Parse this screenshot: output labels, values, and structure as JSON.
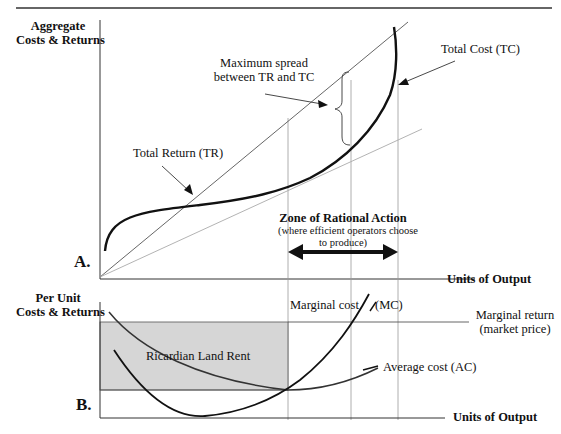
{
  "panel_a": {
    "tag": "A.",
    "y_axis_title_line1": "Aggregate",
    "y_axis_title_line2": "Costs & Returns",
    "x_axis_title": "Units of Output",
    "labels": {
      "total_cost": "Total Cost (TC)",
      "total_return": "Total Return (TR)",
      "max_spread_line1": "Maximum spread",
      "max_spread_line2": "between TR and TC",
      "zone_title": "Zone of Rational Action",
      "zone_sub_line1": "(where efficient operators choose",
      "zone_sub_line2": "to produce)"
    }
  },
  "panel_b": {
    "tag": "B.",
    "y_axis_title_line1": "Per Unit",
    "y_axis_title_line2": "Costs & Returns",
    "x_axis_title": "Units of Output",
    "labels": {
      "marginal_cost": "Marginal cost",
      "mc_abbrev": "(MC)",
      "marginal_return_line1": "Marginal return",
      "marginal_return_line2": "(market price)",
      "average_cost": "Average cost  (AC)",
      "land_rent": "Ricardian Land Rent"
    }
  },
  "colors": {
    "curve": "#111111",
    "thin_line": "#555555",
    "light_line": "#aaaaaa",
    "guide_line": "#999999",
    "shaded_area": "#d6d6d6"
  }
}
